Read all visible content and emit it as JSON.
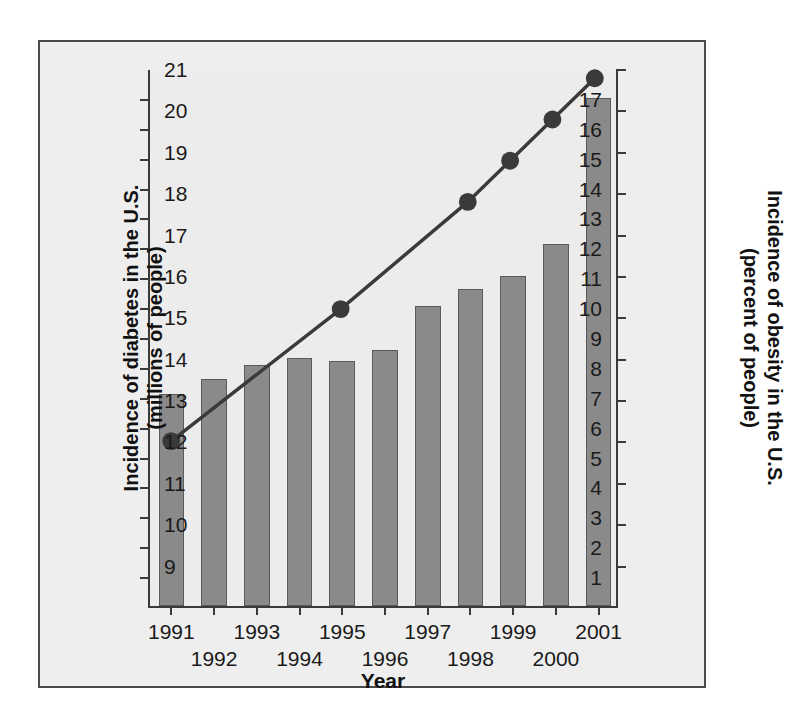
{
  "chart_data": {
    "type": "bar",
    "title": "",
    "xlabel": "Year",
    "categories": [
      "1991",
      "1992",
      "1993",
      "1994",
      "1995",
      "1996",
      "1997",
      "1998",
      "1999",
      "2000",
      "2001"
    ],
    "grid": false,
    "legend": "none",
    "series": [
      {
        "name": "Incidence of diabetes in the U.S. (millions of people)",
        "type": "bar",
        "axis": "left",
        "unit": "millions of people",
        "color": "#8a8a8a",
        "values": [
          7.1,
          7.6,
          8.05,
          8.3,
          8.2,
          8.55,
          10.05,
          10.6,
          11.05,
          12.1,
          17.0
        ]
      },
      {
        "name": "Incidence of obesity in the U.S. (percent of people)",
        "type": "line",
        "axis": "right",
        "unit": "percent of people",
        "color": "#3a3a3a",
        "marker": "filled-circle",
        "x": [
          "1991",
          "1995",
          "1998",
          "1999",
          "2000",
          "2001"
        ],
        "values": [
          12.0,
          15.2,
          17.8,
          18.8,
          19.8,
          20.8
        ]
      }
    ],
    "axes": {
      "left": {
        "label": "Incidence of diabetes in the U.S.\n(millions of people)",
        "ticks": [
          "17",
          "16",
          "15",
          "14",
          "13",
          "12",
          "11",
          "10",
          "9",
          "8",
          "7",
          "6",
          "5",
          "4",
          "3",
          "2",
          "1"
        ],
        "min": 1,
        "max": 17
      },
      "right": {
        "label": "Incidence of obesity in the U.S.\n(percent of people)",
        "ticks": [
          "21",
          "20",
          "19",
          "18",
          "17",
          "16",
          "15",
          "14",
          "13",
          "12",
          "11",
          "10",
          "9"
        ],
        "min": 9,
        "max": 21
      },
      "x": {
        "label": "Year",
        "ticks": [
          "1991",
          "1992",
          "1993",
          "1994",
          "1995",
          "1996",
          "1997",
          "1998",
          "1999",
          "2000",
          "2001"
        ]
      }
    },
    "colors": {
      "bar_fill": "#8a8a8a",
      "bar_stroke": "#5a5a5a",
      "line": "#3a3a3a",
      "marker": "#3a3a3a",
      "axis": "#3a3a3a",
      "frame": "#4a4a4a",
      "background": "#ececec",
      "text": "#111111"
    }
  }
}
